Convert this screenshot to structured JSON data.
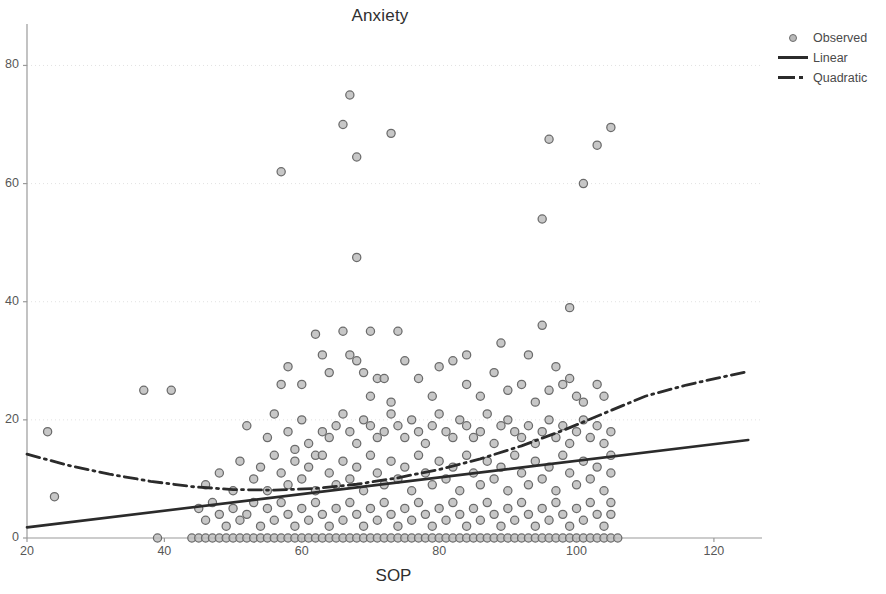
{
  "chart_data": {
    "type": "scatter",
    "title": "Anxiety",
    "xlabel": "SOP",
    "ylabel": "",
    "xlim": [
      20,
      127
    ],
    "ylim": [
      0,
      86
    ],
    "xticks": [
      20,
      40,
      60,
      80,
      100,
      120
    ],
    "yticks": [
      0,
      20,
      40,
      60,
      80
    ],
    "grid": "faint-dotted-horizontal",
    "legend_position": "top-right",
    "legend": [
      {
        "label": "Observed",
        "marker": "circle",
        "style": "marker"
      },
      {
        "label": "Linear",
        "marker": "solid-line",
        "style": "line"
      },
      {
        "label": "Quadratic",
        "marker": "dash-dot-line",
        "style": "line"
      }
    ],
    "colors": {
      "marker_fill": "#bdbdbd",
      "marker_stroke": "#6b6b6b",
      "line": "#2b2b2b",
      "axis": "#9a9a9a",
      "grid": "#e2e2e2",
      "text": "#3a3a3a"
    },
    "series": [
      {
        "name": "Observed",
        "type": "scatter",
        "points": [
          [
            23,
            18
          ],
          [
            24,
            7
          ],
          [
            37,
            25
          ],
          [
            41,
            25
          ],
          [
            57,
            62
          ],
          [
            67,
            75
          ],
          [
            66,
            70
          ],
          [
            73,
            68.5
          ],
          [
            68,
            64.5
          ],
          [
            68,
            47.5
          ],
          [
            95,
            54
          ],
          [
            96,
            67.5
          ],
          [
            103,
            66.5
          ],
          [
            105,
            69.5
          ],
          [
            101,
            60
          ],
          [
            99,
            39
          ],
          [
            95,
            36
          ],
          [
            93,
            31
          ],
          [
            89,
            33
          ],
          [
            84,
            31
          ],
          [
            74,
            35
          ],
          [
            70,
            35
          ],
          [
            66,
            35
          ],
          [
            62,
            34.5
          ],
          [
            58,
            29
          ],
          [
            57,
            26
          ],
          [
            60,
            26
          ],
          [
            63,
            31
          ],
          [
            64,
            28
          ],
          [
            67,
            31
          ],
          [
            68,
            30
          ],
          [
            69,
            28
          ],
          [
            70,
            24
          ],
          [
            71,
            27
          ],
          [
            72,
            27
          ],
          [
            73,
            23
          ],
          [
            75,
            30
          ],
          [
            77,
            27
          ],
          [
            79,
            24
          ],
          [
            80,
            29
          ],
          [
            82,
            30
          ],
          [
            84,
            26
          ],
          [
            86,
            24
          ],
          [
            88,
            28
          ],
          [
            90,
            25
          ],
          [
            92,
            26
          ],
          [
            94,
            23
          ],
          [
            96,
            25
          ],
          [
            98,
            26
          ],
          [
            100,
            24
          ],
          [
            101,
            23
          ],
          [
            103,
            26
          ],
          [
            104,
            24
          ],
          [
            99,
            27
          ],
          [
            97,
            29
          ],
          [
            52,
            19
          ],
          [
            55,
            17
          ],
          [
            56,
            21
          ],
          [
            58,
            18
          ],
          [
            59,
            15
          ],
          [
            60,
            20
          ],
          [
            61,
            16
          ],
          [
            62,
            14
          ],
          [
            63,
            18
          ],
          [
            64,
            17
          ],
          [
            65,
            19
          ],
          [
            66,
            21
          ],
          [
            67,
            18
          ],
          [
            68,
            16
          ],
          [
            69,
            20
          ],
          [
            70,
            19
          ],
          [
            71,
            17
          ],
          [
            72,
            18
          ],
          [
            73,
            21
          ],
          [
            74,
            19
          ],
          [
            75,
            17
          ],
          [
            76,
            20
          ],
          [
            77,
            18
          ],
          [
            78,
            16
          ],
          [
            79,
            19
          ],
          [
            80,
            21
          ],
          [
            81,
            18
          ],
          [
            82,
            17
          ],
          [
            83,
            20
          ],
          [
            84,
            19
          ],
          [
            85,
            17
          ],
          [
            86,
            18
          ],
          [
            87,
            21
          ],
          [
            88,
            16
          ],
          [
            89,
            19
          ],
          [
            90,
            20
          ],
          [
            91,
            18
          ],
          [
            92,
            17
          ],
          [
            93,
            19
          ],
          [
            94,
            16
          ],
          [
            95,
            18
          ],
          [
            96,
            20
          ],
          [
            97,
            17
          ],
          [
            98,
            19
          ],
          [
            99,
            16
          ],
          [
            100,
            18
          ],
          [
            101,
            20
          ],
          [
            102,
            17
          ],
          [
            103,
            19
          ],
          [
            104,
            16
          ],
          [
            105,
            18
          ],
          [
            105,
            14
          ],
          [
            105,
            11
          ],
          [
            46,
            9
          ],
          [
            47,
            6
          ],
          [
            48,
            11
          ],
          [
            50,
            8
          ],
          [
            51,
            13
          ],
          [
            53,
            10
          ],
          [
            54,
            12
          ],
          [
            55,
            8
          ],
          [
            56,
            14
          ],
          [
            57,
            11
          ],
          [
            58,
            9
          ],
          [
            59,
            13
          ],
          [
            60,
            10
          ],
          [
            61,
            12
          ],
          [
            62,
            8
          ],
          [
            63,
            14
          ],
          [
            64,
            11
          ],
          [
            65,
            9
          ],
          [
            66,
            13
          ],
          [
            67,
            10
          ],
          [
            68,
            12
          ],
          [
            69,
            8
          ],
          [
            70,
            14
          ],
          [
            71,
            11
          ],
          [
            72,
            9
          ],
          [
            73,
            13
          ],
          [
            74,
            10
          ],
          [
            75,
            12
          ],
          [
            76,
            8
          ],
          [
            77,
            14
          ],
          [
            78,
            11
          ],
          [
            79,
            9
          ],
          [
            80,
            13
          ],
          [
            81,
            10
          ],
          [
            82,
            12
          ],
          [
            83,
            8
          ],
          [
            84,
            14
          ],
          [
            85,
            11
          ],
          [
            86,
            9
          ],
          [
            87,
            13
          ],
          [
            88,
            10
          ],
          [
            89,
            12
          ],
          [
            90,
            8
          ],
          [
            91,
            14
          ],
          [
            92,
            11
          ],
          [
            93,
            9
          ],
          [
            94,
            13
          ],
          [
            95,
            10
          ],
          [
            96,
            12
          ],
          [
            97,
            8
          ],
          [
            98,
            14
          ],
          [
            99,
            11
          ],
          [
            100,
            9
          ],
          [
            101,
            13
          ],
          [
            102,
            10
          ],
          [
            103,
            12
          ],
          [
            104,
            8
          ],
          [
            105,
            6
          ],
          [
            45,
            5
          ],
          [
            46,
            3
          ],
          [
            48,
            4
          ],
          [
            49,
            2
          ],
          [
            50,
            5
          ],
          [
            51,
            3
          ],
          [
            52,
            4
          ],
          [
            53,
            6
          ],
          [
            54,
            2
          ],
          [
            55,
            5
          ],
          [
            56,
            3
          ],
          [
            57,
            6
          ],
          [
            58,
            4
          ],
          [
            59,
            2
          ],
          [
            60,
            5
          ],
          [
            61,
            3
          ],
          [
            62,
            6
          ],
          [
            63,
            4
          ],
          [
            64,
            2
          ],
          [
            65,
            5
          ],
          [
            66,
            3
          ],
          [
            67,
            6
          ],
          [
            68,
            4
          ],
          [
            69,
            2
          ],
          [
            70,
            5
          ],
          [
            71,
            3
          ],
          [
            72,
            6
          ],
          [
            73,
            4
          ],
          [
            74,
            2
          ],
          [
            75,
            5
          ],
          [
            76,
            3
          ],
          [
            77,
            6
          ],
          [
            78,
            4
          ],
          [
            79,
            2
          ],
          [
            80,
            5
          ],
          [
            81,
            3
          ],
          [
            82,
            6
          ],
          [
            83,
            4
          ],
          [
            84,
            2
          ],
          [
            85,
            5
          ],
          [
            86,
            3
          ],
          [
            87,
            6
          ],
          [
            88,
            4
          ],
          [
            89,
            2
          ],
          [
            90,
            5
          ],
          [
            91,
            3
          ],
          [
            92,
            6
          ],
          [
            93,
            4
          ],
          [
            94,
            2
          ],
          [
            95,
            5
          ],
          [
            96,
            3
          ],
          [
            97,
            6
          ],
          [
            98,
            4
          ],
          [
            99,
            2
          ],
          [
            100,
            5
          ],
          [
            101,
            3
          ],
          [
            102,
            6
          ],
          [
            103,
            4
          ],
          [
            104,
            2
          ],
          [
            105,
            4
          ],
          [
            39,
            0
          ],
          [
            44,
            0
          ],
          [
            45,
            0
          ],
          [
            46,
            0
          ],
          [
            47,
            0
          ],
          [
            48,
            0
          ],
          [
            49,
            0
          ],
          [
            50,
            0
          ],
          [
            51,
            0
          ],
          [
            52,
            0
          ],
          [
            53,
            0
          ],
          [
            54,
            0
          ],
          [
            55,
            0
          ],
          [
            56,
            0
          ],
          [
            57,
            0
          ],
          [
            58,
            0
          ],
          [
            59,
            0
          ],
          [
            60,
            0
          ],
          [
            61,
            0
          ],
          [
            62,
            0
          ],
          [
            63,
            0
          ],
          [
            64,
            0
          ],
          [
            65,
            0
          ],
          [
            66,
            0
          ],
          [
            67,
            0
          ],
          [
            68,
            0
          ],
          [
            69,
            0
          ],
          [
            70,
            0
          ],
          [
            71,
            0
          ],
          [
            72,
            0
          ],
          [
            73,
            0
          ],
          [
            74,
            0
          ],
          [
            75,
            0
          ],
          [
            76,
            0
          ],
          [
            77,
            0
          ],
          [
            78,
            0
          ],
          [
            79,
            0
          ],
          [
            80,
            0
          ],
          [
            81,
            0
          ],
          [
            82,
            0
          ],
          [
            83,
            0
          ],
          [
            84,
            0
          ],
          [
            85,
            0
          ],
          [
            86,
            0
          ],
          [
            87,
            0
          ],
          [
            88,
            0
          ],
          [
            89,
            0
          ],
          [
            90,
            0
          ],
          [
            91,
            0
          ],
          [
            92,
            0
          ],
          [
            93,
            0
          ],
          [
            94,
            0
          ],
          [
            95,
            0
          ],
          [
            96,
            0
          ],
          [
            97,
            0
          ],
          [
            98,
            0
          ],
          [
            99,
            0
          ],
          [
            100,
            0
          ],
          [
            101,
            0
          ],
          [
            102,
            0
          ],
          [
            103,
            0
          ],
          [
            104,
            0
          ],
          [
            105,
            0
          ],
          [
            106,
            0
          ]
        ]
      },
      {
        "name": "Linear",
        "type": "line",
        "style": "solid",
        "endpoints": [
          [
            20,
            1.8
          ],
          [
            125,
            16.6
          ]
        ]
      },
      {
        "name": "Quadratic",
        "type": "line",
        "style": "dash-dot",
        "curve": [
          [
            20,
            14.2
          ],
          [
            26,
            12.3
          ],
          [
            32,
            10.8
          ],
          [
            38,
            9.6
          ],
          [
            44,
            8.7
          ],
          [
            50,
            8.2
          ],
          [
            56,
            8.1
          ],
          [
            62,
            8.4
          ],
          [
            68,
            9.1
          ],
          [
            74,
            10.2
          ],
          [
            80,
            11.6
          ],
          [
            86,
            13.4
          ],
          [
            92,
            15.6
          ],
          [
            98,
            18.2
          ],
          [
            104,
            21.1
          ],
          [
            110,
            24.0
          ],
          [
            116,
            25.9
          ],
          [
            121,
            27.2
          ],
          [
            125,
            28.2
          ]
        ]
      }
    ]
  }
}
